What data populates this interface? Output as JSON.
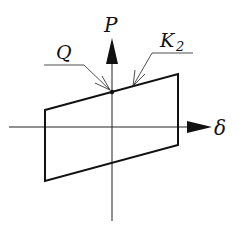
{
  "diagram": {
    "type": "hysteresis-loop",
    "axes": {
      "vertical_label": "P",
      "horizontal_label": "δ"
    },
    "annotations": [
      {
        "label": "Q",
        "sub": ""
      },
      {
        "label": "K",
        "sub": "2"
      }
    ],
    "colors": {
      "line": "#111111",
      "background": "#ffffff"
    }
  }
}
